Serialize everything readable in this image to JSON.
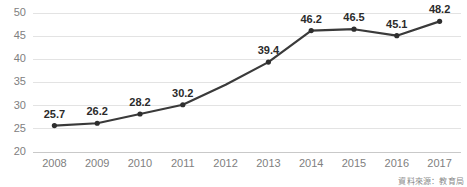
{
  "chart_data": {
    "type": "line",
    "title": "",
    "subtitle": "",
    "xlabel": "",
    "ylabel": "",
    "categories": [
      "2008",
      "2009",
      "2010",
      "2011",
      "2012",
      "2013",
      "2014",
      "2015",
      "2016",
      "2017"
    ],
    "values": [
      25.7,
      26.2,
      28.2,
      30.2,
      34.5,
      39.4,
      46.2,
      46.5,
      45.1,
      48.2
    ],
    "point_labels": [
      "25.7",
      "26.2",
      "28.2",
      "30.2",
      "",
      "39.4",
      "46.2",
      "46.5",
      "45.1",
      "48.2"
    ],
    "markers": [
      true,
      true,
      true,
      true,
      false,
      true,
      true,
      true,
      true,
      true
    ],
    "ylim": [
      20,
      50
    ],
    "yticks": [
      20,
      25,
      30,
      35,
      40,
      45,
      50
    ],
    "ytick_labels": [
      "20",
      "25",
      "30",
      "35",
      "40",
      "45",
      "50"
    ],
    "grid": true,
    "legend": false,
    "legend_position": "none",
    "series_color": "#3a3a3a",
    "gridline_color": "#e3e3e3",
    "axis_color": "#c9c9c9",
    "tick_label_color": "#808080",
    "data_label_color": "#2b2b2b",
    "background_color": "#ffffff"
  },
  "footer": {
    "source_note": "資料來源：教育局"
  }
}
